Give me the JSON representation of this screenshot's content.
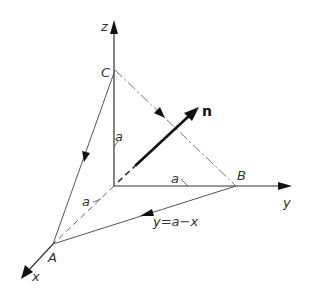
{
  "diagram": {
    "type": "3d-coordinate-diagram",
    "axes": {
      "x_label": "x",
      "y_label": "y",
      "z_label": "z"
    },
    "points": {
      "A": "A",
      "B": "B",
      "C": "C"
    },
    "vector_label": "n",
    "segment_labels": {
      "z_a": "a",
      "x_a": "a",
      "y_a": "a"
    },
    "line_equation": "y=a−x"
  }
}
